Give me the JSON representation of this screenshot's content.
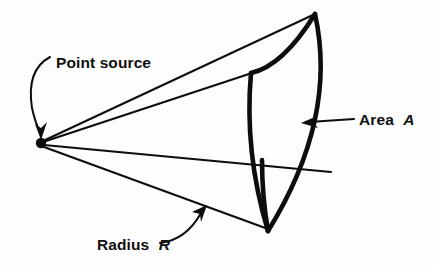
{
  "figure": {
    "background_color": "#fdfdfd",
    "ink_color": "#0d0d0d"
  },
  "labels": {
    "point_source": "Point source",
    "area_prefix": "Area",
    "area_symbol": "A",
    "radius_prefix": "Radius",
    "radius_symbol": "R"
  },
  "geometry": {
    "apex": {
      "x": 41,
      "y": 143,
      "dot_radius": 5
    },
    "cap_corners": {
      "top": {
        "x": 315,
        "y": 13
      },
      "near_top": {
        "x": 252,
        "y": 72
      },
      "near_bottom": {
        "x": 268,
        "y": 230
      },
      "right_bulge_x": 332
    },
    "rays": [
      {
        "name": "upper-far-ray",
        "to_x": 315,
        "to_y": 13
      },
      {
        "name": "upper-near-ray",
        "to_x": 252,
        "to_y": 72
      },
      {
        "name": "center-ray",
        "to_x": 330,
        "to_y": 170
      },
      {
        "name": "lower-ray",
        "to_x": 268,
        "to_y": 230
      }
    ]
  },
  "annotations": {
    "point_source_arrow_tip": {
      "x": 41,
      "y": 137
    },
    "area_arrow_tip": {
      "x": 303,
      "y": 122
    },
    "radius_arrow_tip": {
      "x": 207,
      "y": 207
    }
  }
}
